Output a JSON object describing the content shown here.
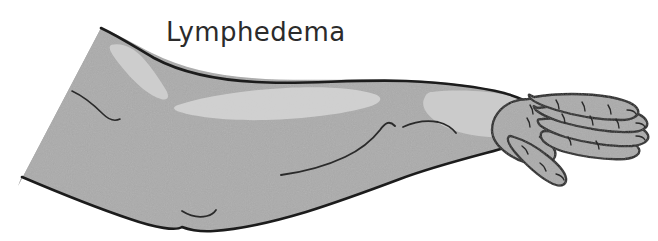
{
  "figure": {
    "name": "lymphedema-arm-illustration",
    "caption": "Lymphedema",
    "alt_description": "Medical line illustration of a swollen arm and hand affected by lymphedema, shaded in gray with lighter highlight areas",
    "background_color": "#ffffff"
  },
  "label": {
    "text": "Lymphedema",
    "color": "#2b2b2b",
    "font_size_px": 26
  },
  "palette": {
    "skin_fill": "#ababab",
    "skin_fill_alt": "#b0b0b0",
    "highlight_fill": "#cfcfcf",
    "highlight_fill_soft": "#c7c7c7",
    "outline": "#1c1c1c",
    "crease_line": "#2a2a2a",
    "background": "#ffffff"
  },
  "anatomy": {
    "parts": [
      {
        "id": "upper-arm",
        "label": "Upper arm (swollen)"
      },
      {
        "id": "elbow",
        "label": "Elbow"
      },
      {
        "id": "forearm",
        "label": "Forearm (swollen)"
      },
      {
        "id": "wrist",
        "label": "Wrist"
      },
      {
        "id": "hand",
        "label": "Hand (swollen dorsum)"
      },
      {
        "id": "thumb",
        "label": "Thumb"
      },
      {
        "id": "index-finger",
        "label": "Index finger"
      },
      {
        "id": "middle-finger",
        "label": "Middle finger"
      },
      {
        "id": "ring-finger",
        "label": "Ring finger"
      },
      {
        "id": "little-finger",
        "label": "Little finger"
      }
    ],
    "highlights": [
      {
        "id": "upper-arm-highlight",
        "label": "Upper arm highlight"
      },
      {
        "id": "forearm-highlight",
        "label": "Forearm highlight"
      },
      {
        "id": "wrist-highlight",
        "label": "Wrist and hand highlight"
      }
    ],
    "creases": [
      {
        "id": "shoulder-crease",
        "label": "Shoulder crease"
      },
      {
        "id": "forearm-crease",
        "label": "Forearm contour crease"
      },
      {
        "id": "wrist-crease",
        "label": "Wrist crease"
      },
      {
        "id": "elbow-fold-crease",
        "label": "Lower arm fold crease"
      }
    ]
  }
}
